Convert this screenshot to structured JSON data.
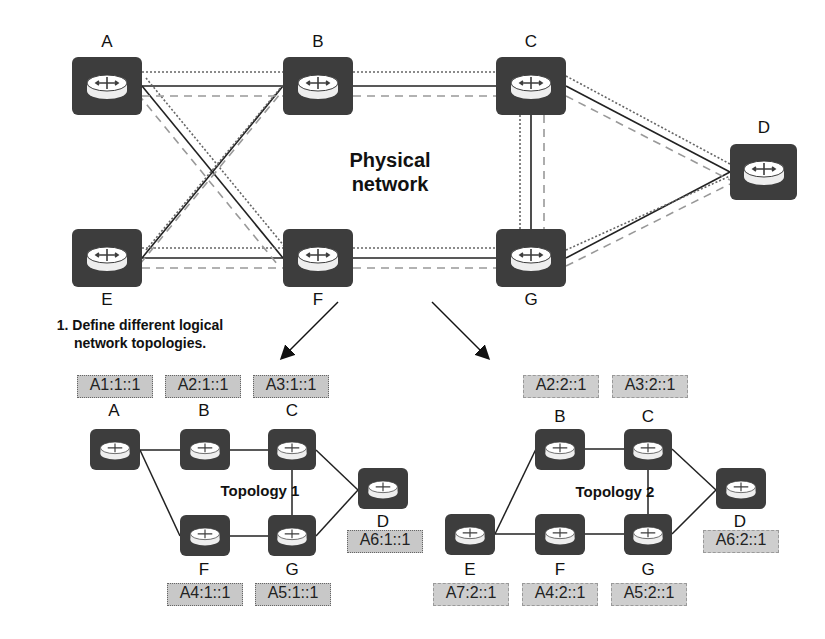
{
  "physical": {
    "title_line1": "Physical",
    "title_line2": "network",
    "nodes": {
      "A": "A",
      "B": "B",
      "C": "C",
      "D": "D",
      "E": "E",
      "F": "F",
      "G": "G"
    }
  },
  "step": {
    "line1": "1. Define different logical",
    "line2": "network topologies."
  },
  "topology1": {
    "title": "Topology 1",
    "nodes": {
      "A": "A",
      "B": "B",
      "C": "C",
      "D": "D",
      "F": "F",
      "G": "G"
    },
    "sids": {
      "A": "A1:1::1",
      "B": "A2:1::1",
      "C": "A3:1::1",
      "F": "A4:1::1",
      "G": "A5:1::1",
      "D": "A6:1::1"
    }
  },
  "topology2": {
    "title": "Topology 2",
    "nodes": {
      "B": "B",
      "C": "C",
      "D": "D",
      "E": "E",
      "F": "F",
      "G": "G"
    },
    "sids": {
      "B": "A2:2::1",
      "C": "A3:2::1",
      "F": "A4:2::1",
      "G": "A5:2::1",
      "D": "A6:2::1",
      "E": "A7:2::1"
    }
  },
  "colors": {
    "router": "#3d3d3d",
    "sid_bg": "#c8c8c8",
    "link_solid": "#222222",
    "link_dotted": "#666666",
    "link_dashed": "#999999"
  }
}
